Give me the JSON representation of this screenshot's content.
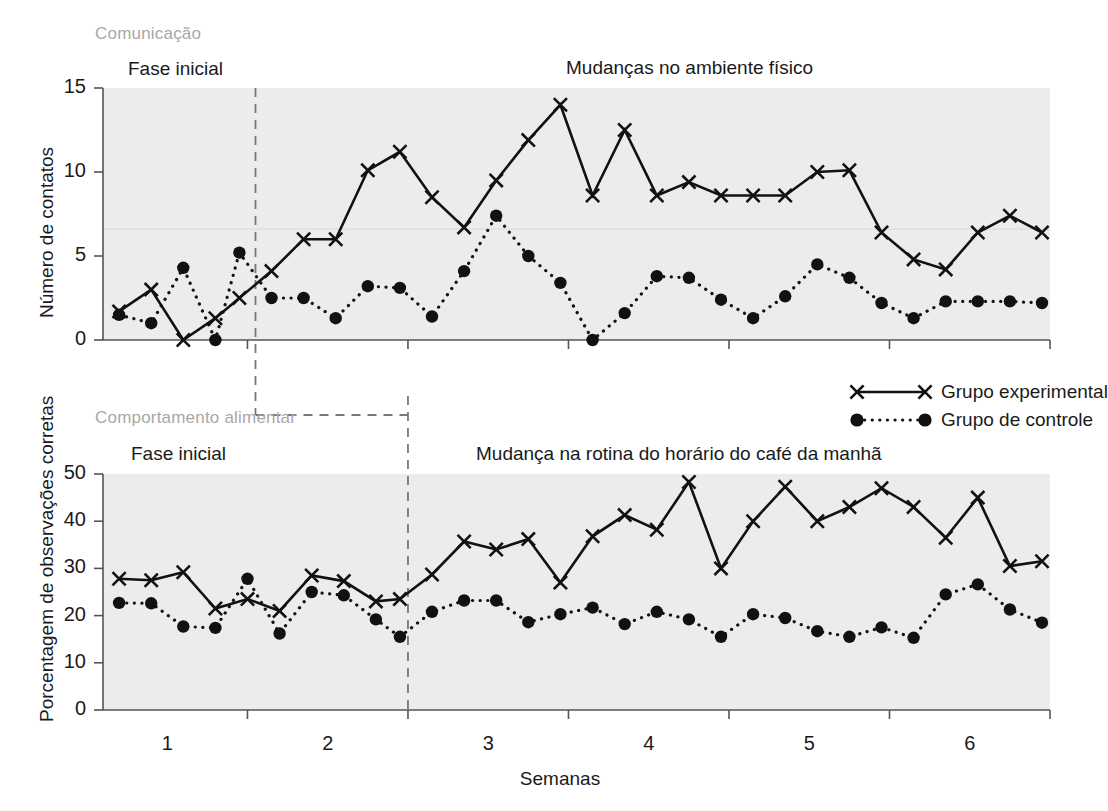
{
  "figure": {
    "x_axis_title": "Semanas",
    "x_tick_labels": [
      "1",
      "2",
      "3",
      "4",
      "5",
      "6"
    ]
  },
  "legend": {
    "experimental_label": "Grupo experimental",
    "control_label": "Grupo de controle"
  },
  "panels": {
    "top": {
      "tag": "Comunicação",
      "baseline_title": "Fase inicial",
      "intervention_title": "Mudanças no ambiente físico",
      "y_axis_title": "Número de contatos",
      "y_tick_labels": [
        "0",
        "5",
        "10",
        "15"
      ]
    },
    "bottom": {
      "tag": "Comportamento alimentar",
      "baseline_title": "Fase inicial",
      "intervention_title": "Mudança na rotina do horário do café da manhã",
      "y_axis_title": "Porcentagem de observações corretas",
      "y_tick_labels": [
        "0",
        "10",
        "20",
        "30",
        "40",
        "50"
      ]
    }
  },
  "colors": {
    "plot_background": "#ececed",
    "line": "#111111",
    "axis": "#555555",
    "tag_text": "#a8a8a8",
    "phase_line": "#777777"
  },
  "chart_data": [
    {
      "type": "line",
      "id": "comunicacao",
      "title": "Comunicação",
      "xlabel": "Semanas",
      "ylabel": "Número de contatos",
      "ylim": [
        0,
        15
      ],
      "yticks": [
        0,
        5,
        10,
        15
      ],
      "xlim": [
        0.6,
        6.5
      ],
      "xticks": [
        1,
        2,
        3,
        4,
        5,
        6
      ],
      "grid": false,
      "phase_change_x": 1.55,
      "phases": [
        {
          "name": "Fase inicial",
          "x_start": 0.6,
          "x_end": 1.55
        },
        {
          "name": "Mudanças no ambiente físico",
          "x_start": 1.55,
          "x_end": 6.5
        }
      ],
      "series": [
        {
          "name": "Grupo experimental",
          "marker": "x",
          "linestyle": "solid",
          "x": [
            0.7,
            0.9,
            1.1,
            1.3,
            1.45,
            1.65,
            1.85,
            2.05,
            2.25,
            2.45,
            2.65,
            2.85,
            3.05,
            3.25,
            3.45,
            3.65,
            3.85,
            4.05,
            4.25,
            4.45,
            4.65,
            4.85,
            5.05,
            5.25,
            5.45,
            5.65,
            5.85,
            6.05,
            6.25,
            6.45
          ],
          "values": [
            1.7,
            3.0,
            0.0,
            1.3,
            2.5,
            4.1,
            6.0,
            6.0,
            10.1,
            11.2,
            8.5,
            6.7,
            9.5,
            11.9,
            14.0,
            8.6,
            12.5,
            8.6,
            9.4,
            8.6,
            8.6,
            8.6,
            10.0,
            10.1,
            6.4,
            4.8,
            4.2,
            6.4,
            7.4,
            6.4
          ]
        },
        {
          "name": "Grupo de controle",
          "marker": "o",
          "linestyle": "dotted",
          "x": [
            0.7,
            0.9,
            1.1,
            1.3,
            1.45,
            1.65,
            1.85,
            2.05,
            2.25,
            2.45,
            2.65,
            2.85,
            3.05,
            3.25,
            3.45,
            3.65,
            3.85,
            4.05,
            4.25,
            4.45,
            4.65,
            4.85,
            5.05,
            5.25,
            5.45,
            5.65,
            5.85,
            6.05,
            6.25,
            6.45
          ],
          "values": [
            1.5,
            1.0,
            4.3,
            0.0,
            5.2,
            2.5,
            2.5,
            1.3,
            3.2,
            3.1,
            1.4,
            4.1,
            7.4,
            5.0,
            3.4,
            0.0,
            1.6,
            3.8,
            3.7,
            2.4,
            1.3,
            2.6,
            4.5,
            3.7,
            2.2,
            1.3,
            2.3,
            2.3,
            2.3,
            2.2
          ]
        }
      ]
    },
    {
      "type": "line",
      "id": "comportamento-alimentar",
      "title": "Comportamento alimentar",
      "xlabel": "Semanas",
      "ylabel": "Porcentagem de observações corretas",
      "ylim": [
        0,
        50
      ],
      "yticks": [
        0,
        10,
        20,
        30,
        40,
        50
      ],
      "xlim": [
        0.6,
        6.5
      ],
      "xticks": [
        1,
        2,
        3,
        4,
        5,
        6
      ],
      "grid": false,
      "phase_change_x": 2.5,
      "phases": [
        {
          "name": "Fase inicial",
          "x_start": 0.6,
          "x_end": 2.5
        },
        {
          "name": "Mudança na rotina do horário do café da manhã",
          "x_start": 2.5,
          "x_end": 6.5
        }
      ],
      "series": [
        {
          "name": "Grupo experimental",
          "marker": "x",
          "linestyle": "solid",
          "x": [
            0.7,
            0.9,
            1.1,
            1.3,
            1.5,
            1.7,
            1.9,
            2.1,
            2.3,
            2.45,
            2.65,
            2.85,
            3.05,
            3.25,
            3.45,
            3.65,
            3.85,
            4.05,
            4.25,
            4.45,
            4.65,
            4.85,
            5.05,
            5.25,
            5.45,
            5.65,
            5.85,
            6.05,
            6.25,
            6.45
          ],
          "values": [
            27.8,
            27.5,
            29.2,
            21.5,
            23.5,
            21.0,
            28.5,
            27.3,
            23.0,
            23.5,
            28.7,
            35.7,
            34.0,
            36.2,
            27.0,
            36.8,
            41.3,
            38.2,
            48.3,
            30.0,
            40.0,
            47.3,
            40.0,
            43.0,
            47.0,
            43.0,
            36.5,
            45.0,
            30.5,
            31.5
          ]
        },
        {
          "name": "Grupo de controle",
          "marker": "o",
          "linestyle": "dotted",
          "x": [
            0.7,
            0.9,
            1.1,
            1.3,
            1.5,
            1.7,
            1.9,
            2.1,
            2.3,
            2.45,
            2.65,
            2.85,
            3.05,
            3.25,
            3.45,
            3.65,
            3.85,
            4.05,
            4.25,
            4.45,
            4.65,
            4.85,
            5.05,
            5.25,
            5.45,
            5.65,
            5.85,
            6.05,
            6.25,
            6.45
          ],
          "values": [
            22.7,
            22.6,
            17.7,
            17.4,
            27.8,
            16.2,
            25.0,
            24.3,
            19.2,
            15.5,
            20.8,
            23.2,
            23.2,
            18.6,
            20.3,
            21.7,
            18.2,
            20.8,
            19.2,
            15.5,
            20.3,
            19.5,
            16.7,
            15.5,
            17.5,
            15.3,
            24.5,
            26.6,
            21.3,
            18.5
          ]
        }
      ]
    }
  ]
}
